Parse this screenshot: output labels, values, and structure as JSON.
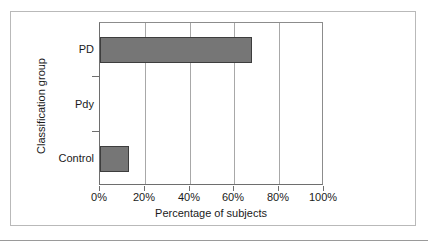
{
  "chart_data": {
    "type": "bar",
    "orientation": "horizontal",
    "title": "",
    "xlabel": "Percentage of subjects",
    "ylabel": "Classification group",
    "categories": [
      "PD",
      "Pdy",
      "Control"
    ],
    "values": [
      68,
      0,
      13
    ],
    "value_labels": [
      "68%",
      "0%",
      "13%"
    ],
    "xlim": [
      0,
      100
    ],
    "xticks": [
      0,
      20,
      40,
      60,
      80,
      100
    ],
    "xtick_labels": [
      "0%",
      "20%",
      "40%",
      "60%",
      "80%",
      "100%"
    ],
    "grid": true,
    "grid_axis": "x",
    "legend": "none",
    "series": [
      {
        "name": "Percentage of subjects",
        "values": [
          68,
          0,
          13
        ]
      }
    ]
  },
  "style": {
    "bar_fill": "#767676",
    "bar_edge": "#3d3d3d",
    "gridline_color": "#a8a8a8",
    "axis_color": "#6e6e6e",
    "frame_color": "#b9b9b9",
    "text_color": "#1a1a1a",
    "background": "#ffffff"
  }
}
